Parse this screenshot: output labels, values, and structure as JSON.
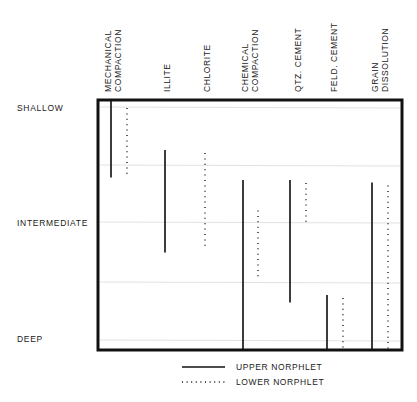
{
  "diagram": {
    "type": "depth-range-chart",
    "depth_levels": [
      "SHALLOW",
      "INTERMEDIATE",
      "DEEP"
    ],
    "columns": [
      {
        "label_lines": [
          "MECHANICAL",
          "COMPACTION"
        ],
        "upper": {
          "start": 0.0,
          "end": 0.31
        },
        "lower": {
          "start": 0.02,
          "end": 0.3
        }
      },
      {
        "label_lines": [
          "ILLITE"
        ],
        "upper": {
          "start": 0.2,
          "end": 0.61
        },
        "lower": null
      },
      {
        "label_lines": [
          "CHLORITE"
        ],
        "upper": null,
        "lower": {
          "start": 0.2,
          "end": 0.6
        }
      },
      {
        "label_lines": [
          "CHEMICAL",
          "COMPACTION"
        ],
        "upper": {
          "start": 0.32,
          "end": 1.0
        },
        "lower": {
          "start": 0.43,
          "end": 0.72
        }
      },
      {
        "label_lines": [
          "QTZ. CEMENT"
        ],
        "upper": {
          "start": 0.32,
          "end": 0.81
        },
        "lower": {
          "start": 0.32,
          "end": 0.5
        }
      },
      {
        "label_lines": [
          "FELD. CEMENT"
        ],
        "upper": {
          "start": 0.78,
          "end": 1.0
        },
        "lower": {
          "start": 0.78,
          "end": 1.0
        }
      },
      {
        "label_lines": [
          "GRAIN",
          "DISSOLUTION"
        ],
        "upper": {
          "start": 0.33,
          "end": 1.0
        },
        "lower": {
          "start": 0.33,
          "end": 1.0
        }
      }
    ],
    "legend": [
      {
        "style": "solid",
        "label": "UPPER NORPHLET"
      },
      {
        "style": "dotted",
        "label": "LOWER NORPHLET"
      }
    ],
    "colors": {
      "ink": "#1a1a1a",
      "grid": "#e2e2e2",
      "background": "#ffffff"
    }
  }
}
